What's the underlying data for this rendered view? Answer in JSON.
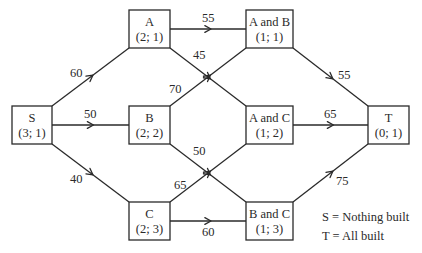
{
  "diagram": {
    "type": "directed-network",
    "colors": {
      "stroke": "#2a2a2a",
      "background": "#ffffff",
      "text": "#2a2a2a"
    },
    "nodes": [
      {
        "id": "S",
        "label": "S",
        "sub": "(3; 1)",
        "x": 12,
        "y": 106,
        "w": 40,
        "h": 38
      },
      {
        "id": "A",
        "label": "A",
        "sub": "(2; 1)",
        "x": 129,
        "y": 10,
        "w": 41,
        "h": 38
      },
      {
        "id": "B",
        "label": "B",
        "sub": "(2; 2)",
        "x": 129,
        "y": 106,
        "w": 41,
        "h": 38
      },
      {
        "id": "C",
        "label": "C",
        "sub": "(2; 3)",
        "x": 129,
        "y": 202,
        "w": 41,
        "h": 38
      },
      {
        "id": "AB",
        "label": "A and B",
        "sub": "(1; 1)",
        "x": 246,
        "y": 10,
        "w": 47,
        "h": 38
      },
      {
        "id": "AC",
        "label": "A and C",
        "sub": "(1; 2)",
        "x": 246,
        "y": 106,
        "w": 47,
        "h": 38
      },
      {
        "id": "BC",
        "label": "B and C",
        "sub": "(1; 3)",
        "x": 246,
        "y": 202,
        "w": 47,
        "h": 38
      },
      {
        "id": "T",
        "label": "T",
        "sub": "(0; 1)",
        "x": 368,
        "y": 106,
        "w": 41,
        "h": 38
      }
    ],
    "edges": [
      {
        "from": "S",
        "to": "A",
        "weight": "60",
        "x1": 52,
        "y1": 106,
        "x2": 129,
        "y2": 48,
        "lx": 70,
        "ly": 77
      },
      {
        "from": "S",
        "to": "B",
        "weight": "50",
        "x1": 52,
        "y1": 125,
        "x2": 129,
        "y2": 125,
        "lx": 84,
        "ly": 118
      },
      {
        "from": "S",
        "to": "C",
        "weight": "40",
        "x1": 52,
        "y1": 144,
        "x2": 129,
        "y2": 202,
        "lx": 70,
        "ly": 183
      },
      {
        "from": "A",
        "to": "AB",
        "weight": "55",
        "x1": 170,
        "y1": 29,
        "x2": 246,
        "y2": 29,
        "lx": 202,
        "ly": 22
      },
      {
        "from": "A",
        "to": "AC",
        "weight": "45",
        "x1": 170,
        "y1": 48,
        "x2": 246,
        "y2": 106,
        "lx": 193,
        "ly": 59
      },
      {
        "from": "B",
        "to": "AB",
        "weight": "70",
        "x1": 170,
        "y1": 106,
        "x2": 246,
        "y2": 48,
        "lx": 169,
        "ly": 93
      },
      {
        "from": "B",
        "to": "BC",
        "weight": "50",
        "x1": 170,
        "y1": 144,
        "x2": 246,
        "y2": 202,
        "lx": 193,
        "ly": 155
      },
      {
        "from": "C",
        "to": "AC",
        "weight": "65",
        "x1": 170,
        "y1": 202,
        "x2": 246,
        "y2": 144,
        "lx": 174,
        "ly": 189
      },
      {
        "from": "C",
        "to": "BC",
        "weight": "60",
        "x1": 170,
        "y1": 221,
        "x2": 246,
        "y2": 221,
        "lx": 202,
        "ly": 236
      },
      {
        "from": "AB",
        "to": "T",
        "weight": "55",
        "x1": 293,
        "y1": 48,
        "x2": 368,
        "y2": 106,
        "lx": 338,
        "ly": 79
      },
      {
        "from": "AC",
        "to": "T",
        "weight": "65",
        "x1": 293,
        "y1": 125,
        "x2": 368,
        "y2": 125,
        "lx": 324,
        "ly": 118
      },
      {
        "from": "BC",
        "to": "T",
        "weight": "75",
        "x1": 293,
        "y1": 202,
        "x2": 368,
        "y2": 144,
        "lx": 336,
        "ly": 185
      }
    ],
    "legend": [
      {
        "text": "S = Nothing built",
        "x": 322,
        "y": 221
      },
      {
        "text": "T = All built",
        "x": 322,
        "y": 240
      }
    ]
  }
}
